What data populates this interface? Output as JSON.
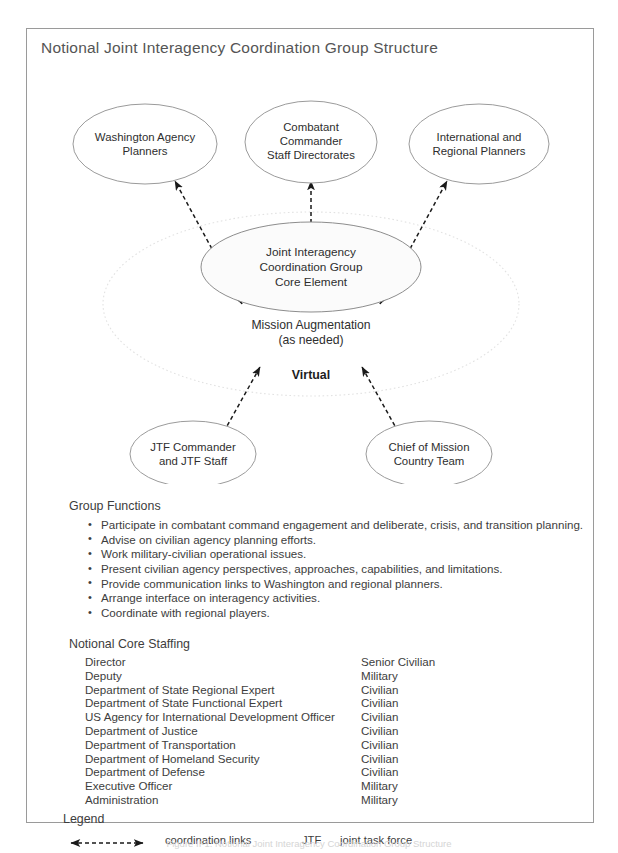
{
  "figure": {
    "title": "Notional Joint Interagency Coordination Group Structure",
    "caption": "Figure II-1. Notional Joint Interagency Coordination Group Structure"
  },
  "diagram": {
    "nodes": {
      "washington": {
        "lines": [
          "Washington Agency",
          "Planners"
        ]
      },
      "combatant": {
        "lines": [
          "Combatant",
          "Commander",
          "Staff Directorates"
        ]
      },
      "international": {
        "lines": [
          "International and",
          "Regional Planners"
        ]
      },
      "core": {
        "lines": [
          "Joint Interagency",
          "Coordination Group",
          "Core Element"
        ]
      },
      "jtf": {
        "lines": [
          "JTF Commander",
          "and JTF Staff"
        ]
      },
      "chief": {
        "lines": [
          "Chief of Mission",
          "Country Team"
        ]
      }
    },
    "augmentation": {
      "lines": [
        "Mission Augmentation",
        "(as needed)"
      ]
    },
    "virtual_label": "Virtual"
  },
  "group_functions": {
    "heading": "Group Functions",
    "items": [
      "Participate in combatant command engagement and deliberate, crisis, and transition planning.",
      "Advise on civilian agency planning efforts.",
      "Work military-civilian operational issues.",
      "Present civilian agency perspectives, approaches, capabilities, and limitations.",
      "Provide communication links to Washington and regional planners.",
      "Arrange interface on interagency activities.",
      "Coordinate with regional players."
    ]
  },
  "core_staffing": {
    "heading": "Notional Core Staffing",
    "rows": [
      {
        "role": "Director",
        "category": "Senior Civilian"
      },
      {
        "role": "Deputy",
        "category": "Military"
      },
      {
        "role": "Department of State Regional Expert",
        "category": "Civilian"
      },
      {
        "role": "Department of State Functional Expert",
        "category": "Civilian"
      },
      {
        "role": "US Agency for International Development Officer",
        "category": "Civilian"
      },
      {
        "role": "Department of Justice",
        "category": "Civilian"
      },
      {
        "role": "Department of Transportation",
        "category": "Civilian"
      },
      {
        "role": "Department of Homeland Security",
        "category": "Civilian"
      },
      {
        "role": "Department of Defense",
        "category": "Civilian"
      },
      {
        "role": "Executive Officer",
        "category": "Military"
      },
      {
        "role": "Administration",
        "category": "Military"
      }
    ]
  },
  "legend": {
    "heading": "Legend",
    "link_label": "coordination links",
    "abbreviation_term": "JTF",
    "abbreviation_definition": "joint task force"
  },
  "colors": {
    "frame_border": "#9a9a9a",
    "ellipse_stroke": "#9b9b9b",
    "core_fill": "#fbfbfb",
    "halo_stroke": "#e2e2e2",
    "link_stroke": "#1a1a1a",
    "text": "#3d3d3d",
    "title_text": "#555555"
  }
}
